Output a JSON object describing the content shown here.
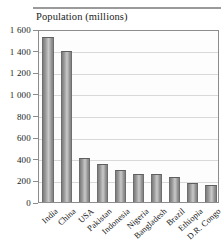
{
  "figure": {
    "title": "Population (millions)"
  },
  "chart_data": {
    "type": "bar",
    "title": "Population (millions)",
    "xlabel": "",
    "ylabel": "Population (millions)",
    "ylim": [
      0,
      1600
    ],
    "grid": true,
    "legend": "none",
    "categories": [
      "India",
      "China",
      "USA",
      "Pakistan",
      "Indonesia",
      "Nigeria",
      "Bangladesh",
      "Brazil",
      "Ethiopia",
      "D.R. Congo"
    ],
    "values": [
      1530,
      1400,
      410,
      350,
      300,
      260,
      255,
      235,
      175,
      155
    ],
    "ytick_labels": [
      "0",
      "200",
      "400",
      "600",
      "800",
      "1 000",
      "1 200",
      "1 400",
      "1 600"
    ],
    "ytick_values": [
      0,
      200,
      400,
      600,
      800,
      1000,
      1200,
      1400,
      1600
    ]
  },
  "colors": {
    "bar_light": "#c8c8c8",
    "bar_dark": "#7d7d7d",
    "axis": "#8c8c8c",
    "grid": "#d9d9d9",
    "text": "#1b1b1b",
    "rule": "#9a9a9a",
    "plot_background": "#fdfdfd"
  }
}
